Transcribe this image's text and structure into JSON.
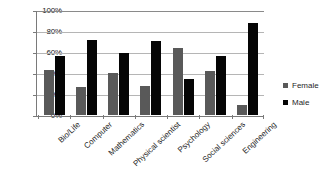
{
  "chart_data": {
    "type": "bar",
    "title": "",
    "xlabel": "",
    "ylabel": "",
    "ylim": [
      0,
      100
    ],
    "yticks": [
      "0%",
      "20%",
      "40%",
      "60%",
      "80%",
      "100%"
    ],
    "ytick_values": [
      0,
      20,
      40,
      60,
      80,
      100
    ],
    "grid": true,
    "legend_position": "right",
    "categories": [
      "Bio/Life",
      "Computer",
      "Mathematics",
      "Physical scientist",
      "Psychology",
      "Social sciences",
      "Engineering"
    ],
    "series": [
      {
        "name": "Female",
        "color": "#595959",
        "values": [
          43,
          27,
          40,
          28,
          64,
          42,
          10
        ]
      },
      {
        "name": "Male",
        "color": "#050505",
        "values": [
          57,
          72,
          60,
          71,
          35,
          57,
          88
        ]
      }
    ]
  },
  "legend": {
    "items": [
      {
        "label": "Female",
        "swatch": "female-swatch"
      },
      {
        "label": "Male",
        "swatch": "male-swatch"
      }
    ]
  }
}
